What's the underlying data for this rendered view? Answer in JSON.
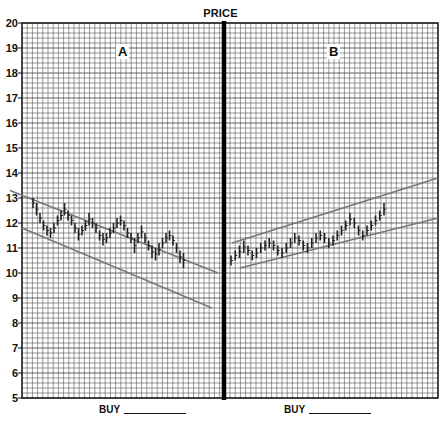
{
  "chart_data": {
    "type": "bar",
    "subtype": "ohlc-range-bars",
    "title": "PRICE",
    "xlabel": "",
    "ylabel": "PRICE",
    "ylim": [
      5,
      20
    ],
    "yticks": [
      5,
      6,
      7,
      8,
      9,
      10,
      11,
      12,
      13,
      14,
      15,
      16,
      17,
      18,
      19,
      20
    ],
    "grid": true,
    "panels": [
      {
        "label": "A",
        "trend": "descending channel",
        "channel_upper": {
          "start": 13.3,
          "end": 10.0
        },
        "channel_lower": {
          "start": 11.8,
          "end": 8.6
        },
        "bars": [
          [
            12.6,
            13.0
          ],
          [
            12.3,
            12.8
          ],
          [
            12.0,
            12.4
          ],
          [
            11.7,
            12.1
          ],
          [
            11.5,
            11.9
          ],
          [
            11.4,
            11.8
          ],
          [
            11.6,
            12.0
          ],
          [
            11.9,
            12.3
          ],
          [
            12.1,
            12.5
          ],
          [
            12.3,
            12.8
          ],
          [
            12.1,
            12.5
          ],
          [
            11.9,
            12.3
          ],
          [
            11.6,
            12.0
          ],
          [
            11.3,
            11.8
          ],
          [
            11.5,
            11.9
          ],
          [
            11.7,
            12.1
          ],
          [
            11.9,
            12.4
          ],
          [
            11.8,
            12.2
          ],
          [
            11.6,
            12.0
          ],
          [
            11.3,
            11.7
          ],
          [
            11.1,
            11.6
          ],
          [
            11.2,
            11.6
          ],
          [
            11.4,
            11.8
          ],
          [
            11.6,
            12.0
          ],
          [
            11.8,
            12.2
          ],
          [
            11.9,
            12.3
          ],
          [
            11.7,
            12.1
          ],
          [
            11.4,
            11.8
          ],
          [
            11.2,
            11.6
          ],
          [
            10.8,
            11.4
          ],
          [
            11.2,
            11.6
          ],
          [
            11.4,
            11.9
          ],
          [
            11.2,
            11.6
          ],
          [
            10.9,
            11.3
          ],
          [
            10.6,
            11.1
          ],
          [
            10.5,
            11.0
          ],
          [
            10.7,
            11.2
          ],
          [
            11.0,
            11.4
          ],
          [
            11.2,
            11.6
          ],
          [
            11.3,
            11.7
          ],
          [
            11.1,
            11.5
          ],
          [
            10.8,
            11.2
          ],
          [
            10.4,
            10.9
          ],
          [
            10.2,
            10.8
          ]
        ]
      },
      {
        "label": "B",
        "trend": "ascending channel",
        "channel_upper": {
          "start": 11.2,
          "end": 13.8
        },
        "channel_lower": {
          "start": 10.2,
          "end": 12.2
        },
        "bars": [
          [
            10.3,
            10.7
          ],
          [
            10.5,
            10.9
          ],
          [
            10.6,
            11.1
          ],
          [
            10.8,
            11.3
          ],
          [
            10.7,
            11.1
          ],
          [
            10.5,
            10.9
          ],
          [
            10.6,
            11.0
          ],
          [
            10.8,
            11.2
          ],
          [
            10.9,
            11.3
          ],
          [
            11.0,
            11.4
          ],
          [
            10.9,
            11.3
          ],
          [
            10.7,
            11.1
          ],
          [
            10.6,
            11.0
          ],
          [
            10.8,
            11.2
          ],
          [
            11.0,
            11.4
          ],
          [
            11.2,
            11.6
          ],
          [
            11.1,
            11.5
          ],
          [
            10.9,
            11.3
          ],
          [
            10.8,
            11.2
          ],
          [
            11.0,
            11.4
          ],
          [
            11.2,
            11.6
          ],
          [
            11.3,
            11.7
          ],
          [
            11.2,
            11.6
          ],
          [
            11.0,
            11.4
          ],
          [
            11.1,
            11.5
          ],
          [
            11.3,
            11.7
          ],
          [
            11.5,
            11.9
          ],
          [
            11.7,
            12.1
          ],
          [
            11.9,
            12.4
          ],
          [
            11.8,
            12.2
          ],
          [
            11.5,
            11.9
          ],
          [
            11.3,
            11.7
          ],
          [
            11.5,
            11.9
          ],
          [
            11.7,
            12.1
          ],
          [
            11.9,
            12.3
          ],
          [
            12.1,
            12.5
          ],
          [
            12.3,
            12.8
          ]
        ]
      }
    ]
  },
  "header": {
    "title": "PRICE"
  },
  "axis": {
    "labels": [
      "20",
      "19",
      "18",
      "17",
      "16",
      "15",
      "14",
      "13",
      "12",
      "11",
      "10",
      "9",
      "8",
      "7",
      "6",
      "5"
    ]
  },
  "panels": {
    "left": {
      "label": "A",
      "buy_label": "BUY"
    },
    "right": {
      "label": "B",
      "buy_label": "BUY"
    }
  },
  "colors": {
    "grid": "#555555",
    "bars": "#222222",
    "channel": "#777777",
    "divider": "#000000"
  }
}
